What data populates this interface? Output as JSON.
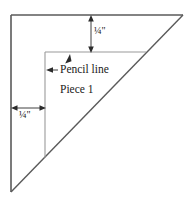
{
  "figure": {
    "background_color": "#ffffff",
    "line_color": "#5a5a5a",
    "inner_line_color": "#8c8c8c",
    "text_color": "#1a1a1a",
    "triangle": {
      "name": "right-triangle-outline",
      "vertices": [
        {
          "x": 11,
          "y": 15
        },
        {
          "x": 183,
          "y": 15
        },
        {
          "x": 11,
          "y": 192
        }
      ]
    },
    "pencil_lines": {
      "horizontal": {
        "x1": 45,
        "y1": 52,
        "x2": 146,
        "y2": 52
      },
      "vertical": {
        "x1": 45,
        "y1": 52,
        "x2": 45,
        "y2": 158
      }
    },
    "dimensions": [
      {
        "name": "top-seam-allowance",
        "label": "¼\"",
        "orientation": "vertical",
        "x": 91,
        "y_start": 16,
        "y_end": 52
      },
      {
        "name": "left-seam-allowance",
        "label": "¼\"",
        "orientation": "horizontal",
        "y": 108,
        "x_start": 12,
        "x_end": 45
      }
    ],
    "callouts": [
      {
        "name": "pencil-line-callout",
        "label": "Pencil line",
        "arrow_to_vertical": {
          "tip_x": 47,
          "tip_y": 70,
          "tail_x": 58,
          "tail_y": 70
        },
        "arrow_to_horizontal": {
          "tip_x": 70,
          "tip_y": 55,
          "tail_x": 65,
          "tail_y": 66
        }
      }
    ],
    "labels": {
      "top_dimension": "¼\"",
      "left_dimension": "¼\"",
      "pencil_line": "Pencil line",
      "piece": "Piece 1"
    }
  }
}
